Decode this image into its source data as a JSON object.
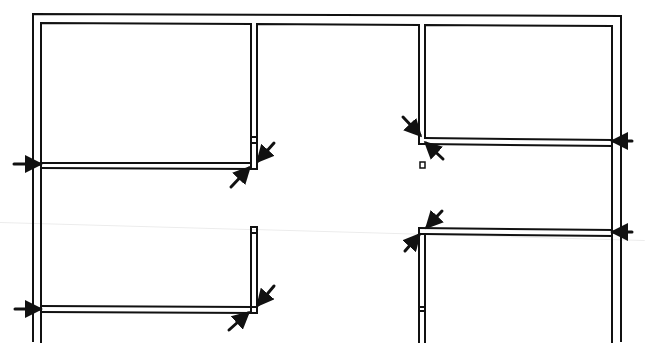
{
  "diagram": {
    "type": "floor-plan",
    "width": 645,
    "height": 352,
    "stroke_color": "#111111",
    "arrow_color": "#111111",
    "background": "#ffffff",
    "wall_stroke_width": 2,
    "arrow_stroke_width": 3,
    "scan_line": {
      "y1": 222,
      "y2": 240,
      "color": "#ececec"
    },
    "outer_wall": {
      "outer_path": "M33,342 L33,14 L621,16 L621,342",
      "inner_left_x": 41,
      "inner_right_x": 612
    },
    "rooms": [
      {
        "name": "room-top-left",
        "rect": {
          "x1": 41,
          "y1": 23,
          "x2": 251,
          "y2": 163
        }
      },
      {
        "name": "room-top-right",
        "rect": {
          "x1": 425,
          "y1": 25,
          "x2": 612,
          "y2": 138
        }
      }
    ],
    "walls": [
      {
        "name": "corridor-top-wall",
        "d": "M257,163 L257,24 L419,25 L419,138"
      },
      {
        "name": "top-left-room-wall",
        "d": "M41,342 L41,23 L251,24 L251,163"
      },
      {
        "name": "top-right-room-wall",
        "d": "M425,138 L425,25 L612,26 L612,342"
      },
      {
        "name": "left-partition-upper-outer",
        "d": "M41,168 L257,169 L257,163"
      },
      {
        "name": "left-partition-upper-inner",
        "d": "M41,163 L251,163"
      },
      {
        "name": "left-partition-upper-cap1",
        "d": "M251,137 L257,137"
      },
      {
        "name": "left-partition-upper-cap2",
        "d": "M251,143 L257,143"
      },
      {
        "name": "left-partition-upper-endcap",
        "d": "M251,163 L251,169"
      },
      {
        "name": "right-partition-upper-a",
        "d": "M425,138 L612,140"
      },
      {
        "name": "right-partition-upper-b",
        "d": "M425,144 L612,146"
      },
      {
        "name": "right-partition-upper-corner",
        "d": "M419,138 L419,144 L425,144"
      },
      {
        "name": "right-partition-lower-a",
        "d": "M419,228 L612,230"
      },
      {
        "name": "right-partition-lower-b",
        "d": "M425,234 L612,236"
      },
      {
        "name": "right-partition-lower-corner",
        "d": "M419,228 L419,342"
      },
      {
        "name": "right-partition-lower-inner",
        "d": "M425,234 L425,342"
      },
      {
        "name": "right-partition-lower-cap",
        "d": "M419,234 L425,234"
      },
      {
        "name": "right-partition-lower-break1",
        "d": "M419,307 L425,307"
      },
      {
        "name": "right-partition-lower-break2",
        "d": "M419,311 L425,311"
      },
      {
        "name": "left-partition-lower-stub-outer",
        "d": "M251,313 L251,227 L257,227 L257,313"
      },
      {
        "name": "left-partition-lower-stub-cap",
        "d": "M251,233 L257,233"
      },
      {
        "name": "left-partition-lower-a",
        "d": "M41,306 L251,307"
      },
      {
        "name": "left-partition-lower-b",
        "d": "M41,312 L257,313"
      },
      {
        "name": "left-partition-lower-endcap",
        "d": "M251,307 L257,307"
      }
    ],
    "markers": [
      {
        "name": "corridor-column-marker",
        "x": 420,
        "y": 162,
        "w": 5,
        "h": 6
      }
    ],
    "arrows": [
      {
        "name": "arrow-left-upper",
        "x1": 14,
        "y1": 164,
        "x2": 40,
        "y2": 164
      },
      {
        "name": "arrow-left-lower",
        "x1": 15,
        "y1": 309,
        "x2": 40,
        "y2": 309
      },
      {
        "name": "arrow-diag-upper-left-a",
        "x1": 274,
        "y1": 143,
        "x2": 258,
        "y2": 161
      },
      {
        "name": "arrow-diag-upper-left-b",
        "x1": 231,
        "y1": 187,
        "x2": 249,
        "y2": 168
      },
      {
        "name": "arrow-diag-lower-left-a",
        "x1": 274,
        "y1": 286,
        "x2": 258,
        "y2": 305
      },
      {
        "name": "arrow-diag-lower-left-b",
        "x1": 229,
        "y1": 330,
        "x2": 248,
        "y2": 313
      },
      {
        "name": "arrow-diag-upper-right-a",
        "x1": 403,
        "y1": 117,
        "x2": 420,
        "y2": 135
      },
      {
        "name": "arrow-diag-upper-right-b",
        "x1": 443,
        "y1": 159,
        "x2": 426,
        "y2": 143
      },
      {
        "name": "arrow-diag-lower-right-a",
        "x1": 442,
        "y1": 211,
        "x2": 427,
        "y2": 227
      },
      {
        "name": "arrow-diag-lower-right-b",
        "x1": 405,
        "y1": 251,
        "x2": 419,
        "y2": 235
      },
      {
        "name": "arrow-right-upper",
        "x1": 632,
        "y1": 141,
        "x2": 613,
        "y2": 141
      },
      {
        "name": "arrow-right-lower",
        "x1": 632,
        "y1": 232,
        "x2": 613,
        "y2": 232
      }
    ]
  }
}
